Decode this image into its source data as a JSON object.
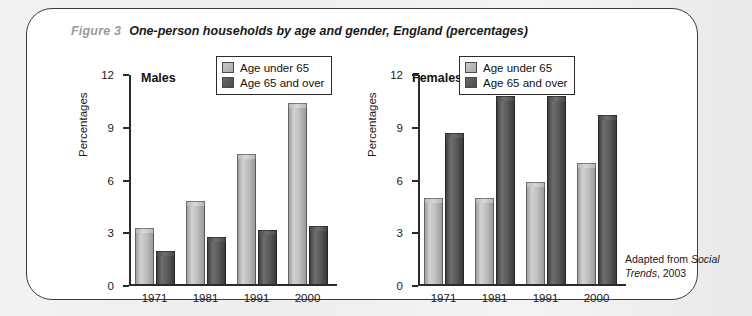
{
  "figure": {
    "number_label": "Figure 3",
    "title": "One-person households by age and gender, England (percentages)"
  },
  "legend": {
    "items": [
      {
        "label": "Age under 65",
        "swatch": "light-gray-swatch",
        "color": "#bdbdbd"
      },
      {
        "label": "Age 65 and over",
        "swatch": "dark-gray-swatch",
        "color": "#555555"
      }
    ]
  },
  "source": {
    "prefix": "Adapted from ",
    "italic": "Social Trends",
    "suffix": ", 2003"
  },
  "axis": {
    "ylabel": "Percentages",
    "ticks": [
      "0",
      "3",
      "6",
      "9",
      "12"
    ]
  },
  "panels": [
    {
      "title": "Males"
    },
    {
      "title": "Females"
    }
  ],
  "chart_data": [
    {
      "type": "bar",
      "title": "Males",
      "categories": [
        "1971",
        "1981",
        "1991",
        "2000"
      ],
      "series": [
        {
          "name": "Age under 65",
          "values": [
            3.2,
            4.7,
            7.4,
            10.3
          ],
          "color": "#bdbdbd"
        },
        {
          "name": "Age 65 and over",
          "values": [
            1.9,
            2.7,
            3.1,
            3.3
          ],
          "color": "#555555"
        }
      ],
      "xlabel": "",
      "ylabel": "Percentages",
      "ylim": [
        0,
        12
      ],
      "yticks": [
        0,
        3,
        6,
        9,
        12
      ],
      "grid": false,
      "legend_position": "top-right"
    },
    {
      "type": "bar",
      "title": "Females",
      "categories": [
        "1971",
        "1981",
        "1991",
        "2000"
      ],
      "series": [
        {
          "name": "Age under 65",
          "values": [
            4.9,
            4.9,
            5.8,
            6.9
          ],
          "color": "#bdbdbd"
        },
        {
          "name": "Age 65 and over",
          "values": [
            8.6,
            10.7,
            10.7,
            9.6
          ],
          "color": "#555555"
        }
      ],
      "xlabel": "",
      "ylabel": "Percentages",
      "ylim": [
        0,
        12
      ],
      "yticks": [
        0,
        3,
        6,
        9,
        12
      ],
      "grid": false,
      "legend_position": "top-right"
    }
  ]
}
